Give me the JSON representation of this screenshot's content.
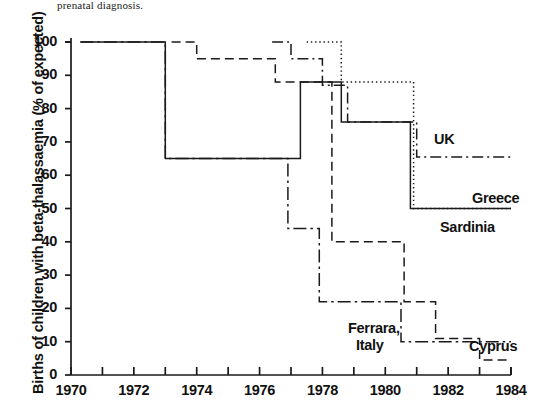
{
  "caption": "prenatal diagnosis.",
  "axes": {
    "ylabel": "Births of children with beta-thalassaemia (% of expected)",
    "xlabel": "",
    "yticks": [
      0,
      10,
      20,
      30,
      40,
      50,
      60,
      70,
      80,
      90,
      100
    ],
    "xticks": [
      1970,
      1972,
      1974,
      1976,
      1978,
      1980,
      1982,
      1984
    ],
    "xminor_step": 1,
    "xlim": [
      1970,
      1984
    ],
    "ylim": [
      0,
      100
    ]
  },
  "labels": {
    "uk": "UK",
    "greece": "Greece",
    "sardinia": "Sardinia",
    "ferrara": "Ferrara,",
    "ferrara2": "Italy",
    "cyprus": "Cyprus"
  },
  "colors": {
    "ink": "#1a1a1a",
    "background": "#ffffff"
  },
  "chart_data": {
    "type": "line",
    "title": "",
    "xlabel": "",
    "ylabel": "Births of children with beta-thalassaemia (% of expected)",
    "xlim": [
      1970,
      1984
    ],
    "ylim": [
      0,
      100
    ],
    "grid": false,
    "legend": "inline-right",
    "step": "post",
    "series": [
      {
        "name": "UK",
        "dash": "dash-dot",
        "x": [
          1976.4,
          1977.0,
          1977.0,
          1977.6,
          1977.6,
          1978.0,
          1978.0,
          1978.8,
          1978.8,
          1981.0,
          1981.0,
          1984.0
        ],
        "values": [
          100,
          100,
          95,
          95,
          95,
          95,
          87,
          87,
          76,
          76,
          65.5,
          65.5
        ]
      },
      {
        "name": "Greece",
        "dash": "dotted",
        "x": [
          1977.5,
          1978.6,
          1978.6,
          1980.9,
          1980.9,
          1984.0
        ],
        "values": [
          100,
          100,
          88,
          88,
          50,
          50
        ]
      },
      {
        "name": "Sardinia",
        "dash": "solid",
        "x": [
          1970.3,
          1973.0,
          1973.0,
          1977.3,
          1977.3,
          1978.6,
          1978.6,
          1980.8,
          1980.8,
          1984.0
        ],
        "values": [
          100,
          100,
          65,
          65,
          88,
          88,
          76,
          76,
          50,
          50
        ]
      },
      {
        "name": "Ferrara, Italy",
        "dash": "dash-dot-long",
        "x": [
          1970.3,
          1973.0,
          1973.0,
          1976.9,
          1976.9,
          1977.9,
          1977.9,
          1980.5,
          1980.5,
          1984.0
        ],
        "values": [
          100,
          100,
          65,
          65,
          44,
          44,
          22,
          22,
          10,
          10
        ]
      },
      {
        "name": "Cyprus",
        "dash": "dashed",
        "x": [
          1973.2,
          1974.0,
          1974.0,
          1976.5,
          1976.5,
          1978.3,
          1978.3,
          1980.6,
          1980.6,
          1981.6,
          1981.6,
          1983.0,
          1983.0,
          1984.0
        ],
        "values": [
          100,
          100,
          95,
          95,
          88,
          88,
          40,
          40,
          22,
          22,
          11,
          11,
          4.5,
          4.5
        ]
      }
    ]
  }
}
